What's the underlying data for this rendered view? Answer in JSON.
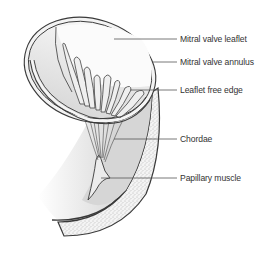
{
  "diagram": {
    "labels": [
      {
        "id": "mitral-valve-leaflet",
        "text": "Mitral valve leaflet",
        "x": 180,
        "y": 34
      },
      {
        "id": "mitral-valve-annulus",
        "text": "Mitral valve annulus",
        "x": 180,
        "y": 57
      },
      {
        "id": "leaflet-free-edge",
        "text": "Leaflet free edge",
        "x": 180,
        "y": 85
      },
      {
        "id": "chordae",
        "text": "Chordae",
        "x": 180,
        "y": 134
      },
      {
        "id": "papillary-muscle",
        "text": "Papillary muscle",
        "x": 180,
        "y": 173
      }
    ],
    "colors": {
      "outline": "#3a3a3a",
      "leader_line": "#555555",
      "inner_fill": "#d9d9d9",
      "light_fill": "#eeeeee",
      "stipple": "#8a8a8a",
      "text": "#333333"
    }
  }
}
